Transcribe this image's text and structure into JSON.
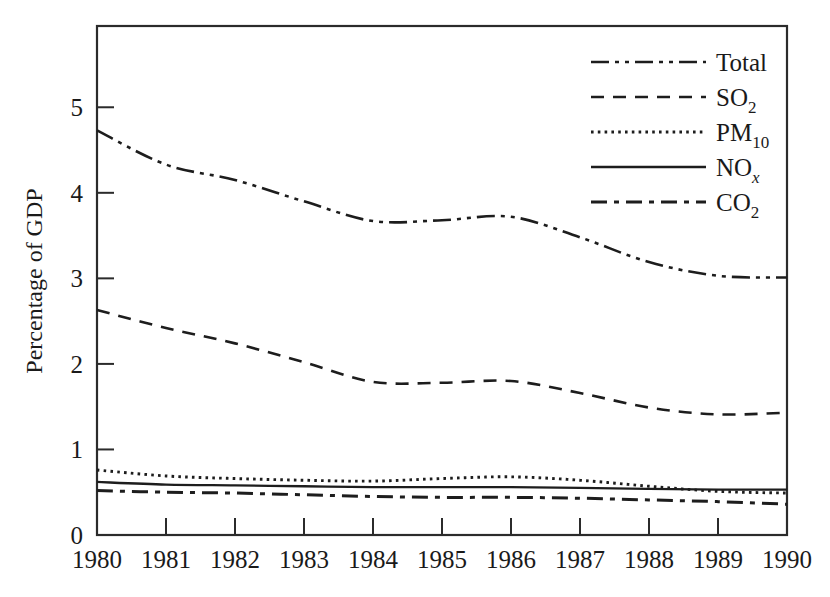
{
  "chart_data": {
    "type": "line",
    "title": "",
    "subtitle": "",
    "xlabel": "",
    "ylabel": "Percentage of GDP",
    "x": [
      1980,
      1981,
      1982,
      1983,
      1984,
      1985,
      1986,
      1987,
      1988,
      1989,
      1990
    ],
    "categories": [
      "1980",
      "1981",
      "1982",
      "1983",
      "1984",
      "1985",
      "1986",
      "1987",
      "1988",
      "1989",
      "1990"
    ],
    "xlim": [
      1980,
      1990
    ],
    "ylim": [
      0,
      5.95
    ],
    "ytick_labels": [
      "0",
      "1",
      "2",
      "3",
      "4",
      "5"
    ],
    "ytick_values": [
      0,
      1,
      2,
      3,
      4,
      5
    ],
    "xtick_labels": [
      "1980",
      "1981",
      "1982",
      "1983",
      "1984",
      "1985",
      "1986",
      "1987",
      "1988",
      "1989",
      "1990"
    ],
    "grid": false,
    "legend_position": "top-right",
    "series": [
      {
        "name": "Total",
        "label_main": "Total",
        "label_sub": "",
        "label_sub_italic": false,
        "style": "dash-dot-dot",
        "dasharray": "18,6,4,6,4,6",
        "width": 2.6,
        "values": [
          4.73,
          4.33,
          4.15,
          3.9,
          3.67,
          3.68,
          3.72,
          3.48,
          3.19,
          3.03,
          3.01
        ]
      },
      {
        "name": "SO2",
        "label_main": "SO",
        "label_sub": "2",
        "label_sub_italic": false,
        "style": "dashed",
        "dasharray": "13,9",
        "width": 2.6,
        "values": [
          2.63,
          2.42,
          2.24,
          2.02,
          1.79,
          1.78,
          1.8,
          1.66,
          1.49,
          1.41,
          1.43
        ]
      },
      {
        "name": "PM10",
        "label_main": "PM",
        "label_sub": "10",
        "label_sub_italic": false,
        "style": "dotted",
        "dasharray": "2.6,4.2",
        "width": 2.9,
        "values": [
          0.76,
          0.69,
          0.66,
          0.64,
          0.63,
          0.66,
          0.68,
          0.64,
          0.57,
          0.51,
          0.49
        ]
      },
      {
        "name": "NOx",
        "label_main": "NO",
        "label_sub": "x",
        "label_sub_italic": true,
        "style": "solid",
        "dasharray": "",
        "width": 2.3,
        "values": [
          0.62,
          0.59,
          0.58,
          0.57,
          0.56,
          0.56,
          0.56,
          0.55,
          0.54,
          0.53,
          0.53
        ]
      },
      {
        "name": "CO2",
        "label_main": "CO",
        "label_sub": "2",
        "label_sub_italic": false,
        "style": "dash-dot",
        "dasharray": "16,7,5,7",
        "width": 3.0,
        "values": [
          0.52,
          0.5,
          0.49,
          0.47,
          0.45,
          0.44,
          0.44,
          0.43,
          0.41,
          0.39,
          0.36
        ]
      }
    ]
  },
  "axes": {
    "ylabel": "Percentage of GDP",
    "ytick_labels": [
      "5",
      "4",
      "3",
      "2",
      "1",
      "0"
    ],
    "xtick_labels": [
      "1980",
      "1981",
      "1982",
      "1983",
      "1984",
      "1985",
      "1986",
      "1987",
      "1988",
      "1989",
      "1990"
    ]
  },
  "legend": {
    "entries": [
      {
        "main": "Total",
        "sub": "",
        "italic_sub": false
      },
      {
        "main": "SO",
        "sub": "2",
        "italic_sub": false
      },
      {
        "main": "PM",
        "sub": "10",
        "italic_sub": false
      },
      {
        "main": "NO",
        "sub": "x",
        "italic_sub": true
      },
      {
        "main": "CO",
        "sub": "2",
        "italic_sub": false
      }
    ]
  },
  "colors": {
    "ink": "#1d1d1d",
    "frame": "#2b2b2b",
    "background": "#ffffff"
  }
}
